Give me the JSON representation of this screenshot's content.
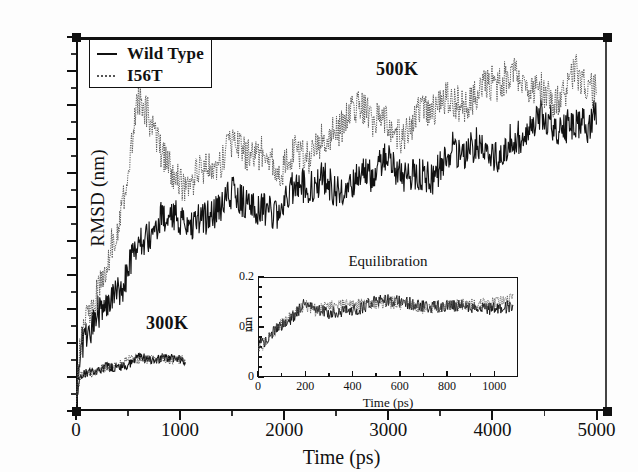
{
  "chart_data": {
    "type": "line",
    "title": "",
    "xlabel": "Time (ps)",
    "ylabel": "RMSD (nm)",
    "xlim": [
      0,
      5100
    ],
    "ylim": [
      0.0,
      1.1
    ],
    "xticks": [
      0,
      1000,
      2000,
      3000,
      4000,
      5000
    ],
    "xticklabels": [
      "0",
      "1000",
      "2000",
      "3000",
      "4000",
      "5000"
    ],
    "yticks": [
      0.0,
      0.1,
      0.2,
      0.3,
      0.4,
      0.5,
      0.6,
      0.7,
      0.8,
      0.9,
      1.0,
      1.1
    ],
    "yticklabels": [
      "0.0",
      "0.1",
      "0.2",
      "0.3",
      "0.4",
      "0.5",
      "0.6",
      "0.7",
      "0.8",
      "0.9",
      "1.0",
      "1.1"
    ],
    "grid": false,
    "legend_position": "upper left",
    "legend": [
      "Wild Type",
      "I56T"
    ],
    "annotations": [
      {
        "text": "500K",
        "x": 2700,
        "y": 1.06
      },
      {
        "text": "300K",
        "x": 800,
        "y": 0.23
      }
    ],
    "series": [
      {
        "name": "Wild Type 500K",
        "style": "solid",
        "color": "#111111",
        "x": [
          0,
          50,
          100,
          150,
          200,
          300,
          400,
          500,
          600,
          700,
          800,
          900,
          1000,
          1200,
          1400,
          1600,
          1800,
          2000,
          2200,
          2400,
          2600,
          2800,
          3000,
          3200,
          3400,
          3600,
          3800,
          4000,
          4200,
          4400,
          4600,
          4800,
          5000
        ],
        "y": [
          0.02,
          0.16,
          0.22,
          0.25,
          0.29,
          0.33,
          0.38,
          0.43,
          0.47,
          0.5,
          0.54,
          0.56,
          0.58,
          0.57,
          0.6,
          0.61,
          0.6,
          0.62,
          0.65,
          0.66,
          0.68,
          0.7,
          0.71,
          0.69,
          0.72,
          0.74,
          0.76,
          0.78,
          0.8,
          0.82,
          0.84,
          0.86,
          0.88
        ]
      },
      {
        "name": "I56T 500K",
        "style": "dotted",
        "color": "#555555",
        "x": [
          0,
          50,
          100,
          150,
          200,
          300,
          400,
          500,
          600,
          700,
          800,
          900,
          1000,
          1200,
          1400,
          1600,
          1800,
          2000,
          2200,
          2400,
          2600,
          2800,
          3000,
          3200,
          3400,
          3600,
          3800,
          4000,
          4200,
          4400,
          4600,
          4800,
          5000
        ],
        "y": [
          0.02,
          0.2,
          0.28,
          0.33,
          0.37,
          0.45,
          0.55,
          0.7,
          0.88,
          0.86,
          0.78,
          0.72,
          0.7,
          0.68,
          0.72,
          0.8,
          0.76,
          0.7,
          0.74,
          0.82,
          0.88,
          0.86,
          0.82,
          0.86,
          0.9,
          0.88,
          0.92,
          1.0,
          0.96,
          0.92,
          0.94,
          1.0,
          0.92
        ]
      },
      {
        "name": "Wild Type 300K",
        "style": "solid",
        "color": "#111111",
        "x": [
          0,
          50,
          100,
          150,
          200,
          300,
          400,
          500,
          600,
          700,
          800,
          900,
          1000,
          1050
        ],
        "y": [
          0.02,
          0.1,
          0.11,
          0.12,
          0.12,
          0.13,
          0.14,
          0.14,
          0.15,
          0.15,
          0.15,
          0.15,
          0.16,
          0.15
        ]
      },
      {
        "name": "I56T 300K",
        "style": "dotted",
        "color": "#555555",
        "x": [
          0,
          50,
          100,
          150,
          200,
          300,
          400,
          500,
          600,
          700,
          800,
          900,
          1000,
          1050
        ],
        "y": [
          0.02,
          0.11,
          0.12,
          0.12,
          0.13,
          0.13,
          0.14,
          0.15,
          0.14,
          0.15,
          0.16,
          0.15,
          0.16,
          0.16
        ]
      }
    ],
    "inset": {
      "type": "line",
      "title": "Equilibration",
      "xlabel": "Time (ps)",
      "ylabel": "nm",
      "xlim": [
        0,
        1100
      ],
      "ylim": [
        0,
        0.2
      ],
      "xticks": [
        0,
        200,
        400,
        600,
        800,
        1000
      ],
      "xticklabels": [
        "0",
        "200",
        "400",
        "600",
        "800",
        "1000"
      ],
      "yticks": [
        0,
        0.1,
        0.2
      ],
      "yticklabels": [
        "0",
        "0.1",
        "0.2"
      ],
      "grid": false,
      "series": [
        {
          "name": "Wild Type",
          "style": "solid",
          "color": "#111111",
          "x": [
            0,
            20,
            40,
            60,
            80,
            100,
            150,
            200,
            250,
            300,
            400,
            500,
            600,
            700,
            800,
            900,
            1000,
            1080
          ],
          "y": [
            0.065,
            0.065,
            0.07,
            0.085,
            0.1,
            0.11,
            0.13,
            0.155,
            0.135,
            0.13,
            0.135,
            0.15,
            0.14,
            0.14,
            0.145,
            0.14,
            0.145,
            0.15
          ]
        },
        {
          "name": "I56T",
          "style": "dotted",
          "color": "#555555",
          "x": [
            0,
            20,
            40,
            60,
            80,
            100,
            150,
            200,
            250,
            300,
            400,
            500,
            600,
            700,
            800,
            900,
            1000,
            1080
          ],
          "y": [
            0.06,
            0.065,
            0.075,
            0.09,
            0.105,
            0.115,
            0.135,
            0.15,
            0.13,
            0.135,
            0.14,
            0.145,
            0.14,
            0.145,
            0.15,
            0.145,
            0.15,
            0.155
          ]
        }
      ]
    }
  },
  "legend": {
    "items": [
      {
        "label": "Wild Type",
        "key": "solid-line-key"
      },
      {
        "label": "I56T",
        "key": "dotted-line-key"
      }
    ]
  },
  "axes": {
    "y_title": "RMSD (nm)",
    "x_title": "Time (ps)"
  },
  "inset_axes": {
    "title": "Equilibration",
    "y_title": "nm",
    "x_title": "Time (ps)"
  },
  "annotations": {
    "high_temp": "500K",
    "low_temp": "300K"
  }
}
